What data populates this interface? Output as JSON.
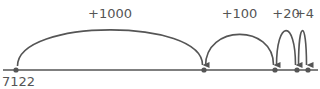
{
  "diagram": {
    "type": "number-line-jumps",
    "start_value": "7122",
    "jumps": [
      {
        "label": "+1000",
        "from_x": 16,
        "to_x": 204,
        "height": 48
      },
      {
        "label": "+100",
        "from_x": 204,
        "to_x": 275,
        "height": 42
      },
      {
        "label": "+20",
        "from_x": 275,
        "to_x": 297,
        "height": 47
      },
      {
        "label": "+4",
        "from_x": 297,
        "to_x": 308,
        "height": 47
      }
    ],
    "colors": {
      "line": "#555555",
      "text": "#555555"
    }
  }
}
